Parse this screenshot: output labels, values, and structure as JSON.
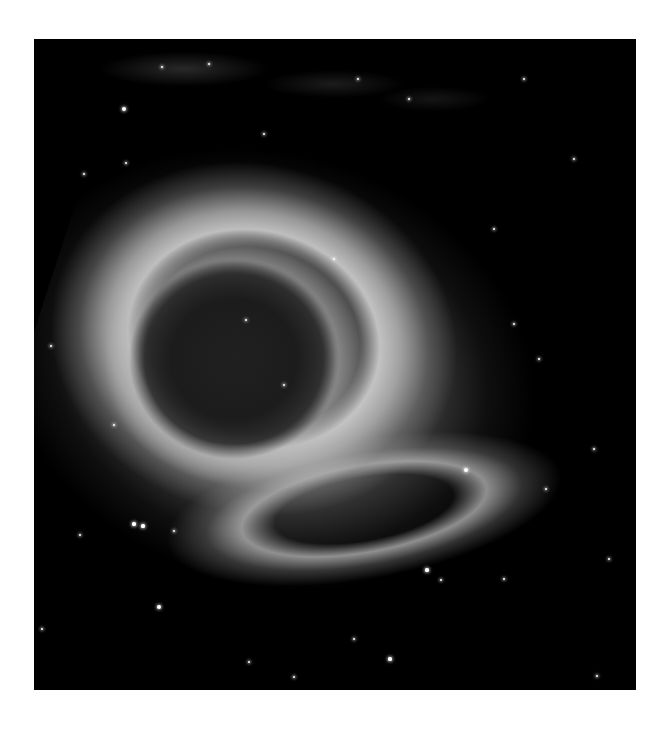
{
  "image": {
    "subject": "planetary nebula (grayscale astronomical photograph)",
    "background": "#ffffff",
    "frame_color": "#000000",
    "colors": {
      "core": "#1e1e1e",
      "ring": "#d7d7d7",
      "halo": "#8c8c8c",
      "star": "#ffffff"
    }
  },
  "stars": [
    {
      "x": 90,
      "y": 70,
      "r": 2
    },
    {
      "x": 128,
      "y": 28,
      "r": 1
    },
    {
      "x": 175,
      "y": 25,
      "r": 1
    },
    {
      "x": 324,
      "y": 40,
      "r": 1.2
    },
    {
      "x": 375,
      "y": 60,
      "r": 1.2
    },
    {
      "x": 490,
      "y": 40,
      "r": 1
    },
    {
      "x": 92,
      "y": 124,
      "r": 1.3
    },
    {
      "x": 50,
      "y": 135,
      "r": 1
    },
    {
      "x": 460,
      "y": 190,
      "r": 1.2
    },
    {
      "x": 480,
      "y": 285,
      "r": 1
    },
    {
      "x": 505,
      "y": 320,
      "r": 1
    },
    {
      "x": 17,
      "y": 307,
      "r": 1.3
    },
    {
      "x": 432,
      "y": 431,
      "r": 2.2
    },
    {
      "x": 512,
      "y": 450,
      "r": 1.2
    },
    {
      "x": 100,
      "y": 485,
      "r": 1.6
    },
    {
      "x": 109,
      "y": 487,
      "r": 1.6
    },
    {
      "x": 46,
      "y": 496,
      "r": 1.3
    },
    {
      "x": 140,
      "y": 492,
      "r": 1
    },
    {
      "x": 125,
      "y": 568,
      "r": 2
    },
    {
      "x": 393,
      "y": 531,
      "r": 1.6
    },
    {
      "x": 407,
      "y": 541,
      "r": 1.2
    },
    {
      "x": 470,
      "y": 540,
      "r": 1
    },
    {
      "x": 356,
      "y": 620,
      "r": 1.6
    },
    {
      "x": 320,
      "y": 600,
      "r": 1
    },
    {
      "x": 215,
      "y": 623,
      "r": 1
    },
    {
      "x": 260,
      "y": 638,
      "r": 1
    },
    {
      "x": 563,
      "y": 637,
      "r": 1.2
    },
    {
      "x": 575,
      "y": 520,
      "r": 1
    },
    {
      "x": 560,
      "y": 410,
      "r": 1
    },
    {
      "x": 8,
      "y": 590,
      "r": 1
    },
    {
      "x": 300,
      "y": 220,
      "r": 1
    },
    {
      "x": 250,
      "y": 346,
      "r": 1
    },
    {
      "x": 212,
      "y": 281,
      "r": 1
    },
    {
      "x": 80,
      "y": 386,
      "r": 1
    },
    {
      "x": 540,
      "y": 120,
      "r": 1
    },
    {
      "x": 230,
      "y": 95,
      "r": 1
    }
  ]
}
